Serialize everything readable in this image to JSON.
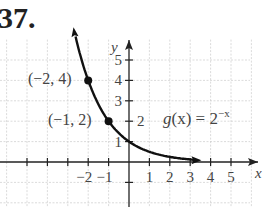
{
  "problem_number": "37.",
  "chart_data": {
    "type": "line",
    "title": "",
    "function_label": "g(x) = 2^-x",
    "xlabel": "x",
    "ylabel": "y",
    "xlim": [
      -6,
      6
    ],
    "ylim": [
      -2,
      6
    ],
    "grid": true,
    "x_ticks": [
      -2,
      -1,
      1,
      2,
      3,
      4,
      5
    ],
    "y_ticks": [
      1,
      2,
      3,
      4,
      5
    ],
    "points": [
      {
        "x": -2,
        "y": 4,
        "label": "(−2, 4)"
      },
      {
        "x": -1,
        "y": 2,
        "label": "(−1, 2)"
      }
    ],
    "series": [
      {
        "name": "g(x) = 2^-x",
        "x": [
          -2.6,
          -2,
          -1,
          0,
          1,
          2,
          3,
          3.5
        ],
        "y": [
          6.06,
          4,
          2,
          1,
          0.5,
          0.25,
          0.125,
          0.088
        ]
      }
    ]
  },
  "labels": {
    "x_axis": "x",
    "y_axis": "y",
    "fn_g": "g",
    "fn_rest": "(x) = 2",
    "fn_exp": "−x",
    "pt1": "(−2, 4)",
    "pt2": "(−1, 2)",
    "xt": [
      "−2",
      "−1",
      "1",
      "2",
      "3",
      "4",
      "5"
    ],
    "yt": [
      "1",
      "2",
      "3",
      "4",
      "5"
    ]
  }
}
